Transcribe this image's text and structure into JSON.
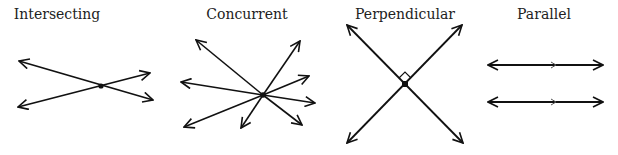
{
  "diagrams": [
    {
      "id": "intersecting",
      "label": "Intersecting",
      "center_x": 57
    },
    {
      "id": "concurrent",
      "label": "Concurrent",
      "center_x": 247
    },
    {
      "id": "perpendicular",
      "label": "Perpendicular",
      "center_x": 405
    },
    {
      "id": "parallel",
      "label": "Parallel",
      "center_x": 544
    }
  ],
  "colors": {
    "stroke": "#111111",
    "text": "#222222",
    "background": "#ffffff"
  }
}
